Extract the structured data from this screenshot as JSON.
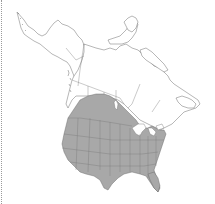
{
  "map": {
    "region": "North America",
    "type": "species range map",
    "colors": {
      "background": "#ffffff",
      "land": "#ffffff",
      "range_fill": "#a8a8a8",
      "boundary_lines": "#6e6e6e",
      "frame_rule": "#9a9a9a"
    },
    "range_description": "Shaded across contiguous United States and southern Canadian prairie provinces (Alberta, Saskatchewan, Manitoba)",
    "legend": []
  }
}
